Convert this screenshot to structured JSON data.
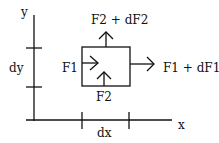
{
  "diagram": {
    "axis_x_label": "x",
    "axis_y_label": "y",
    "dx_label": "dx",
    "dy_label": "dy",
    "force_left": "F1",
    "force_right": "F1 + dF1",
    "force_bottom": "F2",
    "force_top": "F2 + dF2",
    "stroke_color": "#111111",
    "background": "#ffffff"
  }
}
